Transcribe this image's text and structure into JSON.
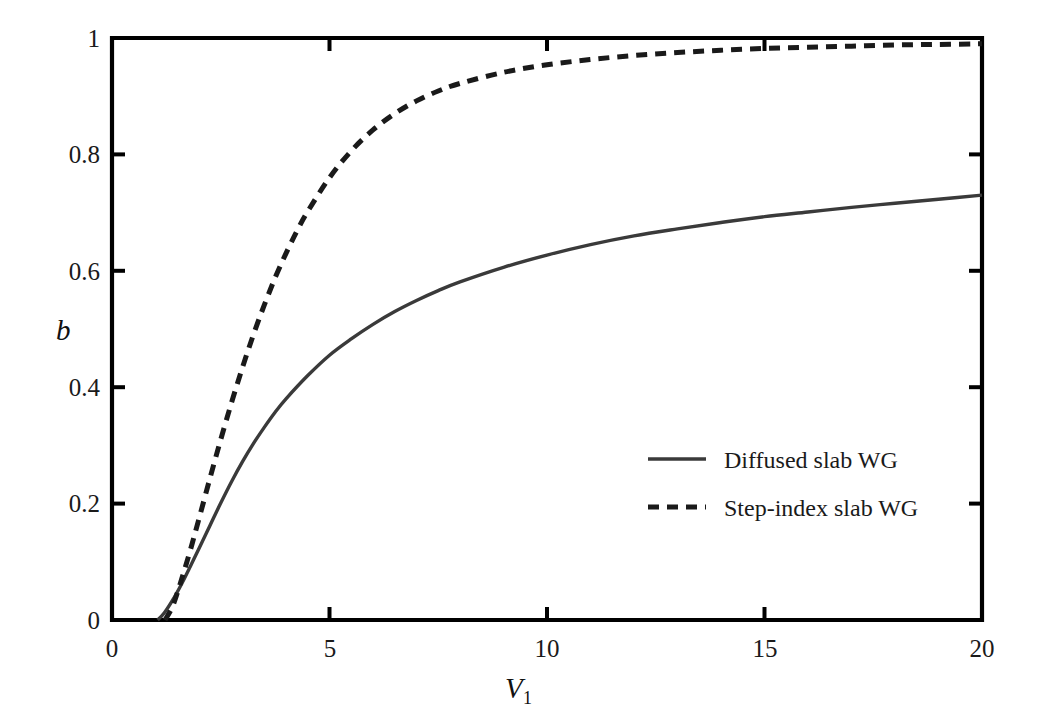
{
  "chart_data": {
    "type": "line",
    "title": "",
    "xlabel": "V1",
    "xlabel_base": "V",
    "xlabel_sub": "1",
    "ylabel": "b",
    "xlim": [
      0,
      20
    ],
    "ylim": [
      0,
      1
    ],
    "grid": false,
    "legend_position": "center-right",
    "x_ticks": [
      0,
      5,
      10,
      15,
      20
    ],
    "x_tick_labels": [
      "0",
      "5",
      "10",
      "15",
      "20"
    ],
    "y_ticks": [
      0,
      0.2,
      0.4,
      0.6,
      0.8,
      1
    ],
    "y_tick_labels": [
      "0",
      "0.2",
      "0.4",
      "0.6",
      "0.8",
      "1"
    ],
    "series": [
      {
        "name": "Diffused slab WG",
        "style": "solid",
        "color": "#3a3a3a",
        "x": [
          1.05,
          1.2,
          1.4,
          1.6,
          1.8,
          2.0,
          2.25,
          2.5,
          2.75,
          3.0,
          3.25,
          3.5,
          3.75,
          4.0,
          4.5,
          5.0,
          5.5,
          6.0,
          6.5,
          7.0,
          7.5,
          8.0,
          9.0,
          10.0,
          11.0,
          12.0,
          13.0,
          14.0,
          15.0,
          16.0,
          17.0,
          18.0,
          19.0,
          20.0
        ],
        "y": [
          0.0,
          0.012,
          0.035,
          0.062,
          0.092,
          0.123,
          0.162,
          0.201,
          0.238,
          0.272,
          0.303,
          0.331,
          0.357,
          0.38,
          0.42,
          0.455,
          0.483,
          0.508,
          0.53,
          0.549,
          0.566,
          0.581,
          0.606,
          0.627,
          0.645,
          0.66,
          0.672,
          0.683,
          0.693,
          0.701,
          0.709,
          0.716,
          0.723,
          0.73
        ]
      },
      {
        "name": "Step-index slab WG",
        "style": "dashed",
        "color": "#1a1a1a",
        "x": [
          1.22,
          1.4,
          1.6,
          1.8,
          2.0,
          2.25,
          2.5,
          2.75,
          3.0,
          3.25,
          3.5,
          3.75,
          4.0,
          4.25,
          4.5,
          5.0,
          5.5,
          6.0,
          6.5,
          7.0,
          7.5,
          8.0,
          9.0,
          10.0,
          11.0,
          12.0,
          13.0,
          14.0,
          15.0,
          16.0,
          17.0,
          18.0,
          19.0,
          20.0
        ],
        "y": [
          0.0,
          0.025,
          0.07,
          0.12,
          0.174,
          0.243,
          0.31,
          0.374,
          0.434,
          0.49,
          0.541,
          0.588,
          0.63,
          0.668,
          0.702,
          0.76,
          0.806,
          0.842,
          0.87,
          0.892,
          0.909,
          0.922,
          0.941,
          0.954,
          0.963,
          0.97,
          0.975,
          0.979,
          0.982,
          0.984,
          0.986,
          0.988,
          0.989,
          0.99
        ]
      }
    ],
    "legend": [
      {
        "label": "Diffused slab WG",
        "style": "solid"
      },
      {
        "label": "Step-index slab WG",
        "style": "dashed"
      }
    ]
  },
  "axes": {
    "y_label": "b",
    "x_label_base": "V",
    "x_label_sub": "1"
  }
}
